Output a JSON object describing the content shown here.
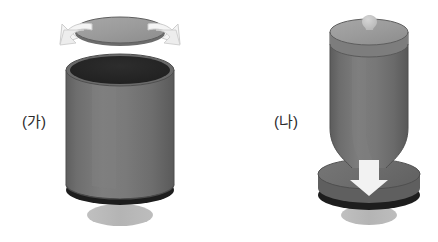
{
  "figure": {
    "type": "diagram",
    "title": "",
    "background_color": "#ffffff",
    "panels": [
      {
        "id": "ga",
        "label": "(가)",
        "label_position": {
          "x": 22,
          "y": 110
        },
        "state": "open",
        "parts": [
          {
            "name": "detached-lid",
            "shape": "ellipse",
            "fill": "#9c9c9c",
            "stroke": "#5e5e5e"
          },
          {
            "name": "lid-rim-shadow",
            "shape": "ellipse-edge",
            "fill": "#6f6f6f"
          },
          {
            "name": "open-mouth-interior",
            "shape": "ellipse",
            "fill": "#262626"
          },
          {
            "name": "cylinder-body",
            "shape": "cylinder",
            "fill": "#757575",
            "stroke": "#4f4f4f"
          },
          {
            "name": "base-dark-rim",
            "shape": "ellipse",
            "fill": "#1d1d1d"
          },
          {
            "name": "ground-shadow",
            "shape": "ellipse",
            "fill": "#b7b7b7"
          },
          {
            "name": "left-curved-arrow",
            "shape": "arrow",
            "fill": "#f2f2f2",
            "stroke": "#c9c9c9",
            "direction": "outward-left"
          },
          {
            "name": "right-curved-arrow",
            "shape": "arrow",
            "fill": "#f2f2f2",
            "stroke": "#c9c9c9",
            "direction": "outward-right"
          }
        ]
      },
      {
        "id": "na",
        "label": "(나)",
        "label_position": {
          "x": 274,
          "y": 110
        },
        "state": "closed",
        "parts": [
          {
            "name": "attached-lid-top",
            "shape": "ellipse",
            "fill": "#9c9c9c",
            "stroke": "#5e5e5e"
          },
          {
            "name": "lid-knob",
            "shape": "bulb",
            "fill": "#c2c2c2"
          },
          {
            "name": "cylinder-body",
            "shape": "tapered-cylinder",
            "fill": "#757575",
            "stroke": "#4f4f4f"
          },
          {
            "name": "base-disc",
            "shape": "ellipse",
            "fill": "#6e6e6e",
            "stroke": "#4f4f4f"
          },
          {
            "name": "base-dark-rim",
            "shape": "ellipse",
            "fill": "#1d1d1d"
          },
          {
            "name": "ground-shadow",
            "shape": "ellipse",
            "fill": "#b7b7b7"
          },
          {
            "name": "down-arrow",
            "shape": "arrow",
            "fill": "#f2f2f2",
            "direction": "down"
          }
        ]
      }
    ],
    "colors": {
      "body": "#757575",
      "body_light": "#8a8a8a",
      "body_dark": "#5c5c5c",
      "lid_top": "#9c9c9c",
      "interior": "#262626",
      "dark_rim": "#1d1d1d",
      "shadow": "#b7b7b7",
      "arrow": "#f2f2f2",
      "arrow_stroke": "#cfcfcf",
      "outline": "#4f4f4f",
      "label_text": "#2b2b2b"
    }
  }
}
